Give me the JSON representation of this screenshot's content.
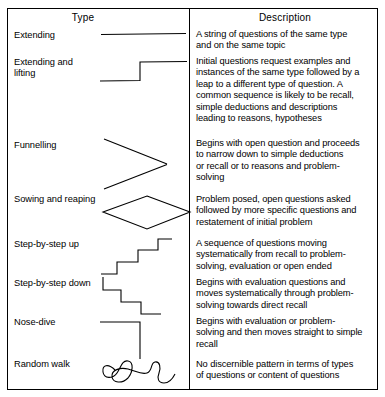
{
  "figure": {
    "headers": {
      "type": "Type",
      "description": "Description"
    },
    "rows": [
      {
        "type": "Extending",
        "type_lines": [
          "Extending"
        ],
        "pattern": "horizontal-line",
        "description": "A string of questions of the same type and on the same topic",
        "description_lines": [
          "A string of questions of the same type",
          "and on the same topic"
        ]
      },
      {
        "type": "Extending and lifting",
        "type_lines": [
          "Extending and",
          "lifting"
        ],
        "pattern": "step-up-single",
        "description": "Initial questions request examples and instances of the same type followed by a leap to a different type of question. A common sequence is likely to be recall, simple deductions and descriptions leading to reasons, hypotheses",
        "description_lines": [
          "Initial questions request examples and",
          "instances of the same type followed by a",
          "leap to a different type of question. A",
          "common sequence is likely to be recall,",
          "simple deductions and descriptions",
          "leading to reasons, hypotheses"
        ]
      },
      {
        "type": "Funnelling",
        "type_lines": [
          "Funnelling"
        ],
        "pattern": "funnel-zigzag",
        "description": "Begins with open question and proceeds to narrow down to simple deductions or recall or to reasons and problem-solving",
        "description_lines": [
          "Begins with open question and proceeds",
          "to narrow down to simple deductions",
          "or recall or to reasons and problem-",
          "solving"
        ]
      },
      {
        "type": "Sowing and reaping",
        "type_lines": [
          "Sowing and reaping"
        ],
        "pattern": "diamond",
        "description": "Problem posed, open questions asked followed by more specific questions and restatement of initial problem",
        "description_lines": [
          "Problem posed, open questions asked",
          "followed by more specific questions and",
          "restatement of initial problem"
        ]
      },
      {
        "type": "Step-by-step up",
        "type_lines": [
          "Step-by-step up"
        ],
        "pattern": "staircase-up",
        "description": "A sequence of questions moving systematically from recall to problem-solving, evaluation or open ended",
        "description_lines": [
          "A sequence of questions moving",
          "systematically from recall to problem-",
          "solving, evaluation or open ended"
        ]
      },
      {
        "type": "Step-by-step down",
        "type_lines": [
          "Step-by-step down"
        ],
        "pattern": "staircase-down",
        "description": "Begins with evaluation questions and moves systematically through problem-solving towards direct recall",
        "description_lines": [
          "Begins with evaluation questions and",
          "moves systematically through problem-",
          "solving towards direct recall"
        ]
      },
      {
        "type": "Nose-dive",
        "type_lines": [
          "Nose-dive"
        ],
        "pattern": "nose-dive",
        "description": "Begins with evaluation or problem-solving and then moves straight to simple recall",
        "description_lines": [
          "Begins with evaluation or problem-",
          "solving and then moves straight to simple",
          "recall"
        ]
      },
      {
        "type": "Random walk",
        "type_lines": [
          "Random walk"
        ],
        "pattern": "squiggle",
        "description": "No discernible pattern in terms of types of questions or content of questions",
        "description_lines": [
          "No discernible pattern in terms of types",
          "of questions or content of questions"
        ]
      }
    ],
    "colors": {
      "ink": "#000000",
      "background": "#ffffff"
    }
  }
}
